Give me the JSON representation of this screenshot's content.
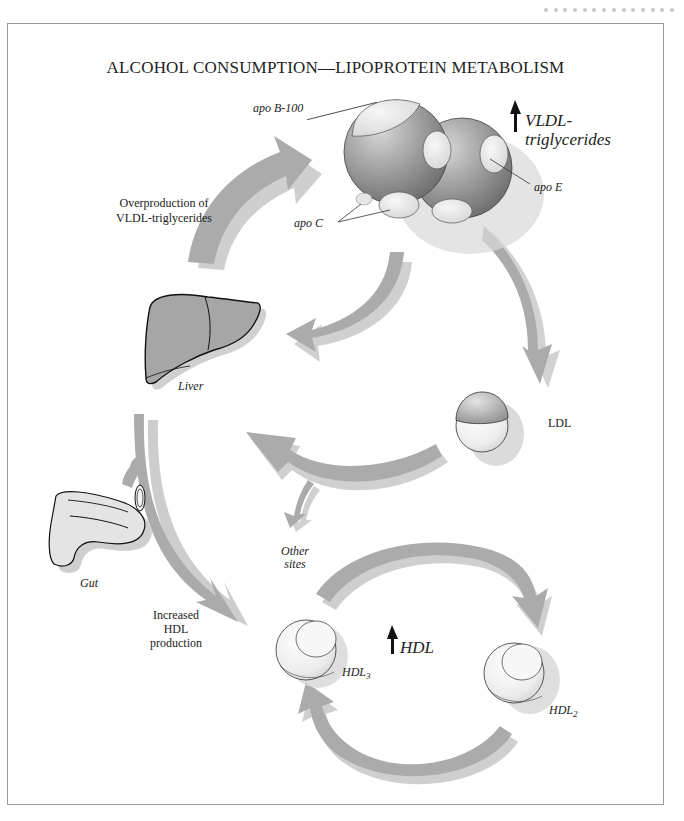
{
  "header": {
    "page_dots_count": 14
  },
  "figure": {
    "title": "ALCOHOL CONSUMPTION—LIPOPROTEIN METABOLISM",
    "labels": {
      "apo_b100": "apo B-100",
      "apo_c": "apo C",
      "apo_e": "apo E",
      "vldl_line1": "VLDL-",
      "vldl_line2": "triglycerides",
      "overproduction_line1": "Overproduction of",
      "overproduction_line2": "VLDL-triglycerides",
      "liver": "Liver",
      "ldl": "LDL",
      "other_sites_line1": "Other",
      "other_sites_line2": "sites",
      "gut": "Gut",
      "increased_line1": "Increased",
      "increased_line2": "HDL",
      "increased_line3": "production",
      "hdl": "HDL",
      "hdl3_base": "HDL",
      "hdl3_sub": "3",
      "hdl2_base": "HDL",
      "hdl2_sub": "2"
    },
    "indicators": {
      "vldl_increase": "up-arrow",
      "hdl_increase": "up-arrow"
    },
    "colors": {
      "arrow_dark": "#a9a9a9",
      "arrow_light": "#cfcfcf",
      "organ_fill": "#a6a6a6",
      "gut_fill": "#e2e2e2",
      "frame_border": "#9a9a9a"
    }
  }
}
